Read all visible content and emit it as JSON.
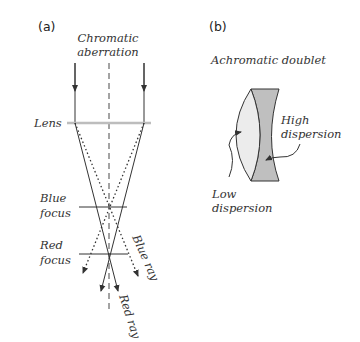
{
  "panel_a": {
    "label": "(a)",
    "title_line1": "Chromatic",
    "title_line2": "aberration",
    "lens_label": "Lens",
    "blue_focus_line1": "Blue",
    "blue_focus_line2": "focus",
    "red_focus_line1": "Red",
    "red_focus_line2": "focus",
    "blue_ray_label": "Blue ray",
    "red_ray_label": "Red ray"
  },
  "panel_b": {
    "label": "(b)",
    "title": "Achromatic doublet",
    "high_line1": "High",
    "high_line2": "dispersion",
    "low_line1": "Low",
    "low_line2": "dispersion"
  },
  "colors": {
    "lens_line": "#bdbdbd",
    "crown_fill": "#ececec",
    "flint_fill": "#bfbfbf",
    "stroke": "#333333"
  }
}
